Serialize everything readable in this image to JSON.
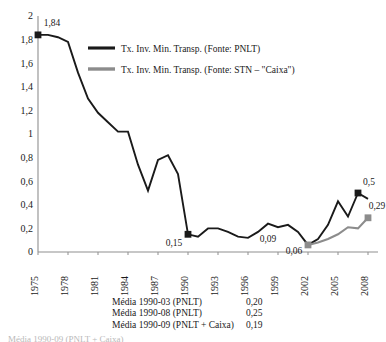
{
  "chart_data": {
    "type": "line",
    "title": "",
    "xlabel": "",
    "ylabel": "",
    "grid": false,
    "legend_position": "top-center",
    "xlim": [
      1975,
      2009
    ],
    "ylim": [
      0,
      2
    ],
    "ytick_labels": [
      "0",
      "0,2",
      "0,4",
      "0,6",
      "0,8",
      "1",
      "1,2",
      "1,4",
      "1,6",
      "1,8",
      "2"
    ],
    "ytick_values": [
      0,
      0.2,
      0.4,
      0.6,
      0.8,
      1,
      1.2,
      1.4,
      1.6,
      1.8,
      2
    ],
    "xtick_labels": [
      "1975",
      "1978",
      "1981",
      "1984",
      "1987",
      "1990",
      "1993",
      "1996",
      "1999",
      "2002",
      "2005",
      "2008"
    ],
    "xtick_values": [
      1975,
      1978,
      1981,
      1984,
      1987,
      1990,
      1993,
      1996,
      1999,
      2002,
      2005,
      2008
    ],
    "series": [
      {
        "name": "Tx. Inv. Min. Transp. (Fonte: PNLT)",
        "color": "#1a1a1a",
        "x": [
          1975,
          1976,
          1977,
          1978,
          1979,
          1980,
          1981,
          1982,
          1983,
          1984,
          1985,
          1986,
          1987,
          1988,
          1989,
          1990,
          1991,
          1992,
          1993,
          1994,
          1995,
          1996,
          1997,
          1998,
          1999,
          2000,
          2001,
          2002,
          2003,
          2004,
          2005,
          2006,
          2007,
          2008
        ],
        "values": [
          1.84,
          1.84,
          1.82,
          1.78,
          1.52,
          1.3,
          1.18,
          1.1,
          1.02,
          1.02,
          0.74,
          0.52,
          0.78,
          0.82,
          0.66,
          0.15,
          0.13,
          0.2,
          0.2,
          0.17,
          0.13,
          0.12,
          0.17,
          0.24,
          0.21,
          0.23,
          0.17,
          0.06,
          0.11,
          0.23,
          0.43,
          0.3,
          0.5,
          0.45
        ]
      },
      {
        "name": "Tx. Inv. Min. Transp. (Fonte: STN – \"Caixa\")",
        "color": "#8c8c8c",
        "x": [
          2002,
          2003,
          2004,
          2005,
          2006,
          2007,
          2008
        ],
        "values": [
          0.06,
          0.08,
          0.11,
          0.15,
          0.21,
          0.2,
          0.29
        ]
      }
    ],
    "point_labels": [
      {
        "text": "1,84",
        "x": 1975,
        "y": 1.84,
        "marker": true,
        "marker_color": "#1a1a1a",
        "dx": 14,
        "dy": -9
      },
      {
        "text": "0,15",
        "x": 1990,
        "y": 0.15,
        "marker": true,
        "marker_color": "#1a1a1a",
        "dx": -14,
        "dy": 12
      },
      {
        "text": "0,09",
        "x": 1998,
        "y": 0.24,
        "marker": false,
        "marker_color": "#1a1a1a",
        "dx": 0,
        "dy": 18
      },
      {
        "text": "0,06",
        "x": 2002,
        "y": 0.06,
        "marker": true,
        "marker_color": "#8c8c8c",
        "dx": -14,
        "dy": 9
      },
      {
        "text": "0,5",
        "x": 2007,
        "y": 0.5,
        "marker": true,
        "marker_color": "#1a1a1a",
        "dx": 11,
        "dy": -8
      },
      {
        "text": "0,29",
        "x": 2008,
        "y": 0.29,
        "marker": true,
        "marker_color": "#8c8c8c",
        "dx": 9,
        "dy": -9
      }
    ]
  },
  "legend": {
    "entries": [
      {
        "label": "Tx. Inv. Min. Transp. (Fonte: PNLT)",
        "color": "#1a1a1a"
      },
      {
        "label": "Tx. Inv. Min. Transp. (Fonte: STN – \"Caixa\")",
        "color": "#8c8c8c"
      }
    ]
  },
  "footnote": {
    "rows": [
      {
        "label": "Média 1990-03 (PNLT)",
        "value": "0,20"
      },
      {
        "label": "Média 1990-08 (PNLT)",
        "value": "0,25"
      },
      {
        "label": "Média 1990-09 (PNLT + Caixa)",
        "value": "0,19"
      }
    ]
  },
  "bottom_caption": {
    "text": "Média 1990-09 (PNLT + Caixa)"
  }
}
